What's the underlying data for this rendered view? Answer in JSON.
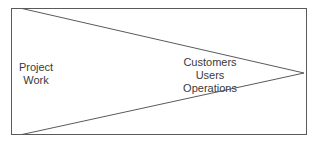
{
  "diagram": {
    "type": "wedge-in-box",
    "colors": {
      "stroke": "#5a5a5a",
      "text": "#3a3a3a",
      "background": "#ffffff"
    },
    "left_label": {
      "lines": [
        "Project",
        "Work"
      ]
    },
    "right_label": {
      "lines": [
        "Customers",
        "Users",
        "Operations"
      ]
    }
  }
}
